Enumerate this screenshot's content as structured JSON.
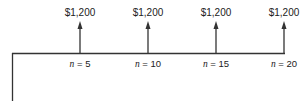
{
  "diagram": {
    "type": "cash-flow-timeline",
    "cash_flows": [
      {
        "amount": "$1,200",
        "period_label": "n = 5",
        "period": 5
      },
      {
        "amount": "$1,200",
        "period_label": "n = 10",
        "period": 10
      },
      {
        "amount": "$1,200",
        "period_label": "n = 15",
        "period": 15
      },
      {
        "amount": "$1,200",
        "period_label": "n = 20",
        "period": 20
      }
    ],
    "line_color": "#333333"
  }
}
